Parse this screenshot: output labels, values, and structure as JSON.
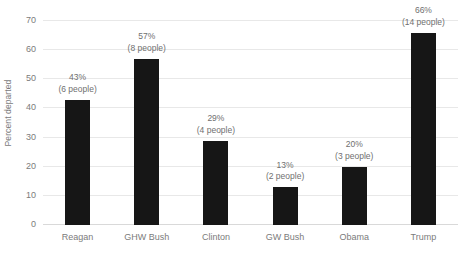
{
  "chart_data": {
    "type": "bar",
    "title": "",
    "xlabel": "",
    "ylabel": "Percent departed",
    "ylim": [
      0,
      70
    ],
    "yticks": [
      0,
      10,
      20,
      30,
      40,
      50,
      60,
      70
    ],
    "grid": true,
    "legend": "none",
    "bar_color": "#161616",
    "axis_text_color": "#7b7b7b",
    "gridline_color": "#e8e8e8",
    "categories": [
      "Reagan",
      "GHW Bush",
      "Clinton",
      "GW Bush",
      "Obama",
      "Trump"
    ],
    "values": [
      43,
      57,
      29,
      13,
      20,
      66
    ],
    "counts": [
      6,
      8,
      4,
      2,
      3,
      14
    ],
    "point_labels": [
      {
        "percent": "43%",
        "people": "(6 people)"
      },
      {
        "percent": "57%",
        "people": "(8 people)"
      },
      {
        "percent": "29%",
        "people": "(4 people)"
      },
      {
        "percent": "13%",
        "people": "(2 people)"
      },
      {
        "percent": "20%",
        "people": "(3 people)"
      },
      {
        "percent": "66%",
        "people": "(14 people)"
      }
    ]
  }
}
